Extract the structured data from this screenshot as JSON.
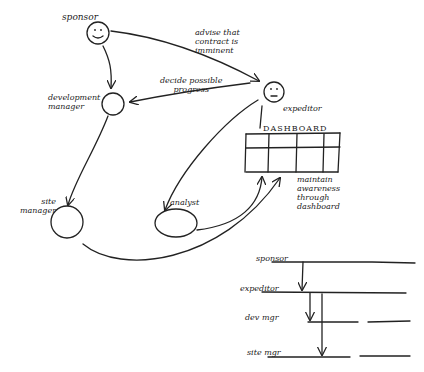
{
  "diagram": {
    "type": "hand-drawn sketch",
    "nodes": [
      {
        "id": "sponsor",
        "label": "sponsor",
        "shape": "face"
      },
      {
        "id": "development_manager",
        "label": "development\nmanager",
        "shape": "circle"
      },
      {
        "id": "expeditor",
        "label": "expeditor",
        "shape": "face"
      },
      {
        "id": "site_manager",
        "label": "site\nmanager",
        "shape": "circle"
      },
      {
        "id": "analyst",
        "label": "analyst",
        "shape": "oval"
      }
    ],
    "dashboard": {
      "title": "DASHBOARD",
      "rows": 2,
      "cols": 4
    },
    "edge_labels": {
      "sponsor_to_expeditor": "advise that\ncontract is\nimminent",
      "expeditor_to_devmgr": "decide possible\nprogress",
      "dashboard_note": "maintain\nawareness\nthrough\ndashboard"
    },
    "edges": [
      {
        "from": "sponsor",
        "to": "expeditor",
        "label": "advise that contract is imminent"
      },
      {
        "from": "sponsor",
        "to": "development_manager"
      },
      {
        "from": "expeditor",
        "to": "development_manager",
        "label": "decide possible progress"
      },
      {
        "from": "development_manager",
        "to": "site_manager"
      },
      {
        "from": "expeditor",
        "to": "analyst"
      },
      {
        "from": "analyst",
        "to": "dashboard"
      },
      {
        "from": "site_manager",
        "to": "dashboard"
      }
    ],
    "swimlanes": {
      "lanes": [
        {
          "label": "sponsor"
        },
        {
          "label": "expeditor"
        },
        {
          "label": "dev mgr"
        },
        {
          "label": "site mgr"
        }
      ],
      "messages": [
        {
          "from": "sponsor",
          "to": "expeditor"
        },
        {
          "from": "expeditor",
          "to": "dev mgr"
        },
        {
          "from": "expeditor",
          "to": "site mgr"
        }
      ]
    }
  }
}
